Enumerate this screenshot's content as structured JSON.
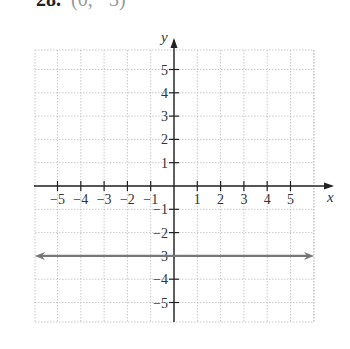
{
  "header": {
    "number": "28.",
    "point": "(0, −3)"
  },
  "chart_data": {
    "type": "line",
    "title": "28. (0, −3)",
    "xlabel": "x",
    "ylabel": "y",
    "xlim": [
      -6,
      6
    ],
    "ylim": [
      -6,
      6
    ],
    "grid": true,
    "xticks": [
      -5,
      -4,
      -3,
      -2,
      -1,
      1,
      2,
      3,
      4,
      5
    ],
    "yticks": [
      -5,
      -4,
      -3,
      -2,
      -1,
      1,
      2,
      3,
      4,
      5
    ],
    "series": [
      {
        "name": "y = -3",
        "x": [
          -6,
          6
        ],
        "y": [
          -3,
          -3
        ],
        "color": "#777777",
        "arrows": "both"
      }
    ]
  }
}
